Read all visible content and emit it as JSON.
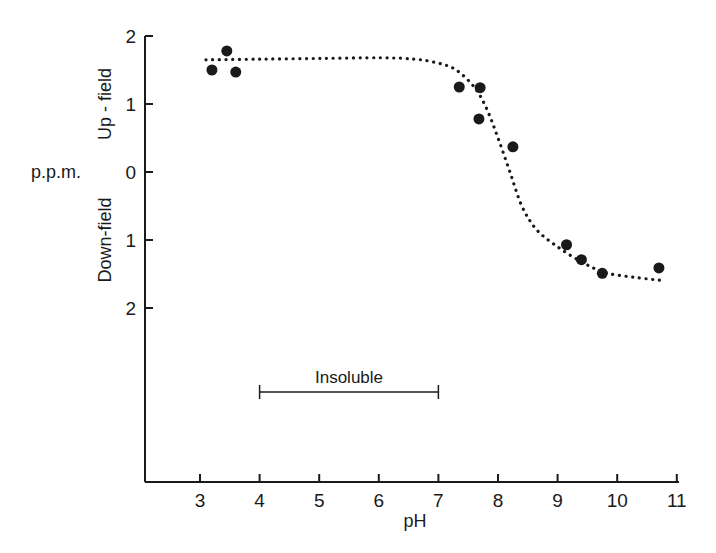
{
  "chart_data": {
    "type": "scatter",
    "title": "",
    "xlabel": "pH",
    "ylabel": "p.p.m.",
    "ylabel_upper": "Up - field",
    "ylabel_lower": "Down-field",
    "xlim": [
      2.25,
      11
    ],
    "ylim": [
      -2,
      2
    ],
    "x_ticks": [
      3,
      4,
      5,
      6,
      7,
      8,
      9,
      10,
      11
    ],
    "y_ticks": [
      2,
      1,
      0,
      -1,
      -2
    ],
    "y_tick_labels": [
      "2",
      "1",
      "0",
      "1",
      "2"
    ],
    "grid": false,
    "legend": null,
    "series": [
      {
        "name": "observed shift",
        "marker": "filled-circle",
        "points": [
          {
            "x": 3.2,
            "y": 1.5
          },
          {
            "x": 3.45,
            "y": 1.78
          },
          {
            "x": 3.6,
            "y": 1.47
          },
          {
            "x": 7.35,
            "y": 1.25
          },
          {
            "x": 7.7,
            "y": 1.24
          },
          {
            "x": 7.68,
            "y": 0.78
          },
          {
            "x": 8.25,
            "y": 0.37
          },
          {
            "x": 9.15,
            "y": -1.07
          },
          {
            "x": 9.4,
            "y": -1.29
          },
          {
            "x": 9.75,
            "y": -1.49
          },
          {
            "x": 10.7,
            "y": -1.41
          }
        ]
      },
      {
        "name": "fitted curve",
        "style": "dotted",
        "points": [
          {
            "x": 3.1,
            "y": 1.65
          },
          {
            "x": 4.0,
            "y": 1.66
          },
          {
            "x": 5.0,
            "y": 1.67
          },
          {
            "x": 6.0,
            "y": 1.68
          },
          {
            "x": 6.6,
            "y": 1.66
          },
          {
            "x": 7.0,
            "y": 1.6
          },
          {
            "x": 7.3,
            "y": 1.5
          },
          {
            "x": 7.6,
            "y": 1.25
          },
          {
            "x": 7.8,
            "y": 0.95
          },
          {
            "x": 8.0,
            "y": 0.5
          },
          {
            "x": 8.2,
            "y": 0.0
          },
          {
            "x": 8.4,
            "y": -0.5
          },
          {
            "x": 8.65,
            "y": -0.85
          },
          {
            "x": 9.0,
            "y": -1.1
          },
          {
            "x": 9.4,
            "y": -1.32
          },
          {
            "x": 9.8,
            "y": -1.48
          },
          {
            "x": 10.3,
            "y": -1.55
          },
          {
            "x": 10.8,
            "y": -1.6
          }
        ]
      }
    ],
    "annotations": [
      {
        "text": "Insoluble",
        "type": "range-bar",
        "x_start": 4,
        "x_end": 7,
        "y_px": 392
      }
    ]
  },
  "labels": {
    "xlabel": "pH",
    "ylabel": "p.p.m.",
    "upfield": "Up - field",
    "downfield": "Down-field",
    "insoluble": "Insoluble"
  }
}
